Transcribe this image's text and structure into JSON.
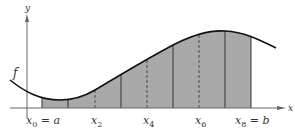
{
  "diagram": {
    "axes": {
      "x_label": "x",
      "y_label": "y"
    },
    "function_label": "f",
    "tick_labels": [
      {
        "base": "x",
        "sub": "0",
        "suffix": " = a",
        "x": 42
      },
      {
        "base": "x",
        "sub": "2",
        "suffix": "",
        "x": 95
      },
      {
        "base": "x",
        "sub": "4",
        "suffix": "",
        "x": 147
      },
      {
        "base": "x",
        "sub": "6",
        "suffix": "",
        "x": 199
      },
      {
        "base": "x",
        "sub": "8",
        "suffix": " = b",
        "x": 251
      }
    ],
    "partition_points": [
      {
        "name": "x0",
        "x": 42,
        "style": "solid"
      },
      {
        "name": "x1",
        "x": 68,
        "style": "solid"
      },
      {
        "name": "x2",
        "x": 95,
        "style": "dashed"
      },
      {
        "name": "x3",
        "x": 121,
        "style": "solid"
      },
      {
        "name": "x4",
        "x": 147,
        "style": "dashed"
      },
      {
        "name": "x5",
        "x": 173,
        "style": "solid"
      },
      {
        "name": "x6",
        "x": 199,
        "style": "dashed"
      },
      {
        "name": "x7",
        "x": 225,
        "style": "solid"
      },
      {
        "name": "x8",
        "x": 251,
        "style": "solid"
      }
    ],
    "colors": {
      "fill": "#a9a9a9",
      "curve": "#111111",
      "axis": "#555555",
      "partition_line": "#333333"
    }
  }
}
